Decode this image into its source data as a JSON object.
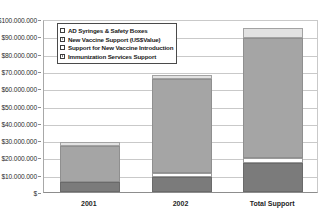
{
  "chart_data": {
    "type": "bar",
    "subtype": "stacked-bar",
    "title": "",
    "xlabel": "",
    "ylabel": "",
    "ylim": [
      0,
      100000000
    ],
    "grid": true,
    "legend_position": "inside-top-left",
    "categories": [
      "2001",
      "2002",
      "Total Support"
    ],
    "y_ticks": [
      {
        "value": 100000000,
        "label": "$100.000.000"
      },
      {
        "value": 90000000,
        "label": "$90.000.000"
      },
      {
        "value": 80000000,
        "label": "$80.000.000"
      },
      {
        "value": 70000000,
        "label": "$70.000.000"
      },
      {
        "value": 60000000,
        "label": "$60.000.000"
      },
      {
        "value": 50000000,
        "label": "$50.000.000"
      },
      {
        "value": 40000000,
        "label": "$40.000.000"
      },
      {
        "value": 30000000,
        "label": "$30.000.000"
      },
      {
        "value": 20000000,
        "label": "$20.000.000"
      },
      {
        "value": 10000000,
        "label": "$10.000.000"
      },
      {
        "value": 0,
        "label": "$ "
      }
    ],
    "series": [
      {
        "name": "Immunization Services Support",
        "color": "#7b7b7b",
        "stack_order": 0,
        "values": [
          5800000,
          8700000,
          16800000
        ]
      },
      {
        "name": "Support for New Vaccine Introduction",
        "color": "#ffffff",
        "stack_order": 1,
        "values": [
          0,
          2300000,
          2900000
        ]
      },
      {
        "name": "New Vaccine Support (US$Value)",
        "color": "#a5a5a5",
        "stack_order": 2,
        "values": [
          20800000,
          54300000,
          69300000
        ]
      },
      {
        "name": "AD Syringes & Safety Boxes",
        "color": "#e2e2e2",
        "stack_order": 3,
        "values": [
          2300000,
          2300000,
          5800000
        ]
      }
    ],
    "totals": [
      28900000,
      67600000,
      94800000
    ],
    "legend": [
      {
        "label": "AD Syringes & Safety Boxes",
        "swatch": "white"
      },
      {
        "label": "New Vaccine Support (US$Value)",
        "swatch": "mid-gray"
      },
      {
        "label": "Support for New Vaccine Introduction",
        "swatch": "white"
      },
      {
        "label": "Immunization Services Support",
        "swatch": "dark-gray"
      }
    ]
  }
}
